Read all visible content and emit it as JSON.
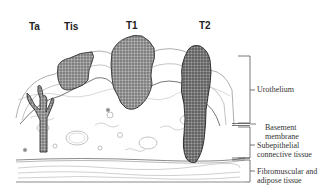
{
  "figure": {
    "stages": [
      {
        "id": "Ta",
        "label": "Ta"
      },
      {
        "id": "Tis",
        "label": "Tis"
      },
      {
        "id": "T1",
        "label": "T1"
      },
      {
        "id": "T2",
        "label": "T2"
      }
    ],
    "layers": [
      {
        "id": "urothelium",
        "label": "Urothelium"
      },
      {
        "id": "basement",
        "label_line1": "Basement",
        "label_line2": "membrane"
      },
      {
        "id": "subepithelial",
        "label_line1": "Subepithelial",
        "label_line2": "connective tissue"
      },
      {
        "id": "fibromuscular",
        "label_line1": "Fibromuscular and",
        "label_line2": "adipose tissue"
      }
    ],
    "colors": {
      "tumor_fill": "#8a8a8a",
      "tumor_stroke": "#333333",
      "tissue_stroke": "#9a9a9a",
      "bracket": "#555555"
    }
  }
}
